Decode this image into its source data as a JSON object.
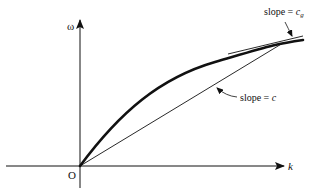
{
  "diagram": {
    "type": "dispersion-relation",
    "axes": {
      "y_label": "ω",
      "x_label": "k",
      "origin_label": "O"
    },
    "annotations": {
      "group_slope": {
        "prefix": "slope = ",
        "symbol": "c",
        "subscript": "g"
      },
      "phase_slope": {
        "prefix": "slope = ",
        "symbol": "c"
      }
    },
    "elements": [
      "curve ω(k), concave down, through origin",
      "chord from origin to point on curve (slope = c)",
      "tangent line at that point (slope = c_g)"
    ],
    "colors": {
      "ink": "#111111",
      "background": "#ffffff"
    }
  }
}
